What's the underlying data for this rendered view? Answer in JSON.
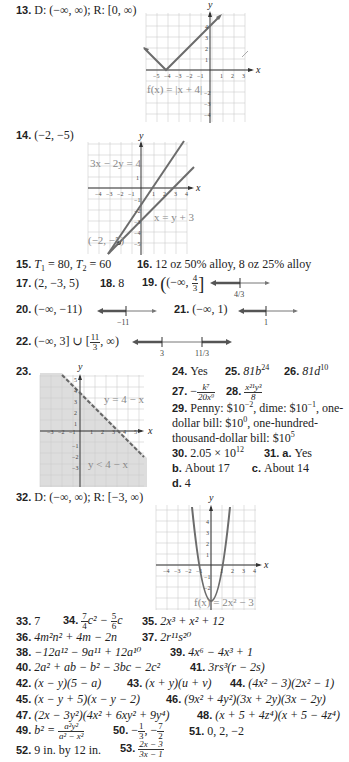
{
  "answers": {
    "a13": {
      "num": "13.",
      "text": "D: (−∞, ∞); R: [0, ∞)"
    },
    "a14": {
      "num": "14.",
      "text": "(−2, −5)"
    },
    "a15": {
      "num": "15.",
      "t1": "T",
      "t1_sub": "1",
      "t1_val": " = 80, ",
      "t2": "T",
      "t2_sub": "2",
      "t2_val": " = 60"
    },
    "a16": {
      "num": "16.",
      "text": "12 oz 50% alloy, 8 oz 25% alloy"
    },
    "a17": {
      "num": "17.",
      "text": "(2, −3, 5)"
    },
    "a18": {
      "num": "18.",
      "text": "8"
    },
    "a19": {
      "num": "19.",
      "pre": "(−∞, ",
      "frac_num": "4",
      "frac_den": "3",
      "post": "]"
    },
    "a20": {
      "num": "20.",
      "text": "(−∞, −11)"
    },
    "a21": {
      "num": "21.",
      "text": "(−∞, 1)"
    },
    "a22": {
      "num": "22.",
      "pre": "(−∞, 3] ∪ [",
      "frac_num": "11",
      "frac_den": "3",
      "post": ", ∞)"
    },
    "a23": {
      "num": "23."
    },
    "a24": {
      "num": "24.",
      "text": "Yes"
    },
    "a25": {
      "num": "25.",
      "base": "81b",
      "exp": "24"
    },
    "a26": {
      "num": "26.",
      "base": "81d",
      "exp": "10"
    },
    "a27": {
      "num": "27.",
      "sign": "−",
      "frac_num": "k⁷",
      "frac_den": "20x⁹"
    },
    "a28": {
      "num": "28.",
      "frac_num": "x²¹y³",
      "frac_den": "8"
    },
    "a29": {
      "num": "29.",
      "line1_a": "Penny: $10",
      "exp1": "−2",
      "line1_b": ", dime: $10",
      "exp2": "−1",
      "line1_c": ", one-",
      "line2_a": "dollar bill: $10",
      "exp3": "0",
      "line2_b": ", one-hundred-",
      "line3_a": "thousand-dollar bill: $10",
      "exp4": "5"
    },
    "a30": {
      "num": "30.",
      "base": "2.05 × 10",
      "exp": "12"
    },
    "a31": {
      "num": "31.",
      "a_label": "a.",
      "a_text": "Yes",
      "b_label": "b.",
      "b_text": "About 17",
      "c_label": "c.",
      "c_text": "About 14",
      "d_label": "d.",
      "d_text": "4"
    },
    "a32": {
      "num": "32.",
      "text": "D: (−∞, ∞); R: [−3, ∞)"
    },
    "a33": {
      "num": "33.",
      "text": "7"
    },
    "a34": {
      "num": "34.",
      "f1n": "7",
      "f1d": "4",
      "mid": "c² − ",
      "f2n": "5",
      "f2d": "6",
      "end": "c"
    },
    "a35": {
      "num": "35.",
      "text": "2x³ + x² + 12"
    },
    "a36": {
      "num": "36.",
      "text": "4m²n² + 4m − 2n"
    },
    "a37": {
      "num": "37.",
      "text": "2r¹¹s²⁰"
    },
    "a38": {
      "num": "38.",
      "text": "−12a¹² − 9a¹¹ + 12a¹⁰"
    },
    "a39": {
      "num": "39.",
      "text": "4x⁶ − 4x³ + 1"
    },
    "a40": {
      "num": "40.",
      "text": "2a² + ab − b² − 3bc − 2c²"
    },
    "a41": {
      "num": "41.",
      "text": "3rs³(r − 2s)"
    },
    "a42": {
      "num": "42.",
      "text": "(x − y)(5 − a)"
    },
    "a43": {
      "num": "43.",
      "text": "(x + y)(u + v)"
    },
    "a44": {
      "num": "44.",
      "text": "(4x² − 3)(2x² − 1)"
    },
    "a45": {
      "num": "45.",
      "text": "(x − y + 5)(x − y − 2)"
    },
    "a46": {
      "num": "46.",
      "text": "(9x² + 4y²)(3x + 2y)(3x − 2y)"
    },
    "a47": {
      "num": "47.",
      "text": "(2x − 3y²)(4x² + 6xy² + 9y⁴)"
    },
    "a48": {
      "num": "48.",
      "text": "(x + 5 + 4z⁴)(x + 5 − 4z⁴)"
    },
    "a49": {
      "num": "49.",
      "pre": "b² = ",
      "frac_num": "a²y²",
      "frac_den": "a² − x²"
    },
    "a50": {
      "num": "50.",
      "f1n": "1",
      "f1d": "3",
      "f2n": "7",
      "f2d": "2"
    },
    "a51": {
      "num": "51.",
      "text": "0, 2, −2"
    },
    "a52": {
      "num": "52.",
      "text": "9 in. by 12 in."
    },
    "a53": {
      "num": "53.",
      "frac_num": "2x − 3",
      "frac_den": "3x − 1"
    }
  },
  "graphs": {
    "g13": {
      "label": "f(x) = |x + 4|",
      "x_axis": "x",
      "y_axis": "y",
      "x_ticks": [
        "−5",
        "−4",
        "−3",
        "−2",
        "−1",
        "1",
        "2",
        "3"
      ],
      "y_ticks": [
        "4",
        "3",
        "2",
        "1",
        "−1",
        "−2",
        "−3",
        "−4"
      ]
    },
    "g14": {
      "label1": "3x − 2y = 4",
      "label2": "x = y + 3",
      "point_label": "(−2, −5)",
      "x_axis": "x",
      "y_axis": "y",
      "x_ticks": [
        "−4",
        "−3",
        "−2",
        "−1",
        "1",
        "2",
        "3",
        "4"
      ],
      "y_ticks": [
        "1",
        "−1",
        "−2",
        "−3",
        "−4",
        "−5"
      ]
    },
    "g19": {
      "tick": "4/3"
    },
    "g20": {
      "tick": "−11"
    },
    "g21": {
      "tick": "1"
    },
    "g22": {
      "tick1": "3",
      "tick2": "11/3"
    },
    "g23": {
      "label1": "y = 4 − x",
      "label2": "y < 4 − x",
      "x_axis": "x",
      "y_axis": "y",
      "x_ticks": [
        "−3",
        "−2",
        "−1",
        "1",
        "2",
        "3",
        "4",
        "5"
      ],
      "y_ticks": [
        "5",
        "4",
        "3",
        "2",
        "1",
        "−1",
        "−2",
        "−3"
      ]
    },
    "g32": {
      "label": "f(x) = 2x² − 3",
      "x_axis": "x",
      "y_axis": "y",
      "x_ticks": [
        "−4",
        "−3",
        "−2",
        "−1",
        "1",
        "2",
        "3",
        "4"
      ],
      "y_ticks": [
        "4",
        "3",
        "2",
        "1",
        "−1",
        "−2",
        "−3"
      ]
    }
  }
}
